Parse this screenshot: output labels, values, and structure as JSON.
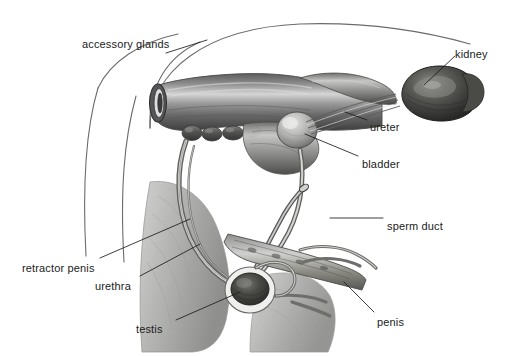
{
  "figure": {
    "kind": "anatomical-illustration",
    "style": "graphite pencil shaded drawing",
    "background_color": "#ffffff",
    "ink_color": "#1b1b1b",
    "width": 510,
    "height": 356
  },
  "labels": [
    {
      "id": "accessory-glands",
      "text": "accessory glands",
      "x": 82,
      "y": 38,
      "align": "left"
    },
    {
      "id": "kidney",
      "text": "kidney",
      "x": 455,
      "y": 48,
      "align": "left"
    },
    {
      "id": "ureter",
      "text": "ureter",
      "x": 370,
      "y": 121,
      "align": "left"
    },
    {
      "id": "bladder",
      "text": "bladder",
      "x": 362,
      "y": 158,
      "align": "left"
    },
    {
      "id": "sperm-duct",
      "text": "sperm duct",
      "x": 387,
      "y": 220,
      "align": "left"
    },
    {
      "id": "retractor-penis",
      "text": "retractor penis",
      "x": 22,
      "y": 262,
      "align": "left"
    },
    {
      "id": "urethra",
      "text": "urethra",
      "x": 95,
      "y": 280,
      "align": "left"
    },
    {
      "id": "testis",
      "text": "testis",
      "x": 136,
      "y": 323,
      "align": "left"
    },
    {
      "id": "penis",
      "text": "penis",
      "x": 377,
      "y": 316,
      "align": "left"
    }
  ],
  "leader_lines": [
    {
      "id": "accessory-glands-leader",
      "from": [
        166,
        53
      ],
      "to": [
        207,
        40
      ]
    },
    {
      "id": "kidney-leader",
      "from": [
        455,
        56
      ],
      "to": [
        424,
        85
      ]
    },
    {
      "id": "ureter-leader",
      "from": [
        367,
        120
      ],
      "to": [
        345,
        112
      ]
    },
    {
      "id": "bladder-leader",
      "from": [
        358,
        156
      ],
      "to": [
        305,
        134
      ]
    },
    {
      "id": "sperm-duct-leader",
      "from": [
        383,
        218
      ],
      "to": [
        330,
        218
      ]
    },
    {
      "id": "retractor-penis-leader",
      "from": [
        100,
        258
      ],
      "to": [
        190,
        219
      ]
    },
    {
      "id": "urethra-leader",
      "from": [
        140,
        276
      ],
      "to": [
        200,
        244
      ]
    },
    {
      "id": "testis-leader",
      "from": [
        176,
        320
      ],
      "to": [
        240,
        292
      ]
    },
    {
      "id": "penis-leader",
      "from": [
        374,
        312
      ],
      "to": [
        344,
        282
      ]
    }
  ],
  "structures": [
    {
      "id": "body-outline",
      "name": "body outline"
    },
    {
      "id": "rectum",
      "name": "rectum"
    },
    {
      "id": "accessory-glands-organ",
      "name": "accessory glands"
    },
    {
      "id": "kidney-organ",
      "name": "kidney"
    },
    {
      "id": "ureter-tube",
      "name": "ureter"
    },
    {
      "id": "bladder-organ",
      "name": "bladder"
    },
    {
      "id": "sperm-duct-tube",
      "name": "sperm duct"
    },
    {
      "id": "urethra-tube",
      "name": "urethra"
    },
    {
      "id": "retractor-penis-muscle",
      "name": "retractor penis muscle"
    },
    {
      "id": "testis-organ",
      "name": "testis"
    },
    {
      "id": "scrotum",
      "name": "scrotum"
    },
    {
      "id": "penis-organ",
      "name": "penis"
    },
    {
      "id": "hind-leg",
      "name": "hind leg"
    }
  ]
}
